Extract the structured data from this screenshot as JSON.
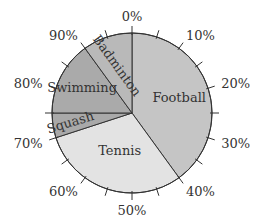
{
  "chart_data": {
    "type": "pie",
    "title": "",
    "start_angle_label": "0%",
    "direction": "clockwise",
    "slices": [
      {
        "label": "Football",
        "value": 40,
        "color": "#c5c5c5"
      },
      {
        "label": "Tennis",
        "value": 30,
        "color": "#e3e3e3"
      },
      {
        "label": "Squash",
        "value": 5,
        "color": "#a9a9a9"
      },
      {
        "label": "Swimming",
        "value": 15,
        "color": "#aaaaaa"
      },
      {
        "label": "Badminton",
        "value": 10,
        "color": "#b9b9b9"
      }
    ],
    "tick_labels": [
      "0%",
      "10%",
      "20%",
      "30%",
      "40%",
      "50%",
      "60%",
      "70%",
      "80%",
      "90%"
    ],
    "minor_tick_step_percent": 5,
    "outline_color": "#333333"
  }
}
